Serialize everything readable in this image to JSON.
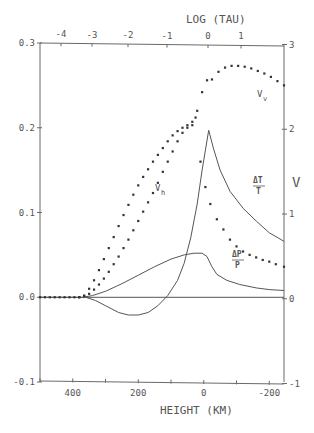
{
  "chart_data": {
    "type": "line",
    "title": "",
    "xlabel": "HEIGHT (KM)",
    "x2label": "LOG (TAU)",
    "ylabel": "",
    "y2label": "V",
    "xlim": [
      500,
      -245
    ],
    "ylim": [
      -0.1,
      0.3
    ],
    "y2lim": [
      -1,
      3
    ],
    "xticks": [
      400,
      200,
      0,
      -200
    ],
    "xticks_minor": [
      500,
      300,
      100,
      -100
    ],
    "x2ticks": [
      {
        "label": "-4",
        "px": 61
      },
      {
        "label": "-3",
        "px": 92
      },
      {
        "label": "-2",
        "px": 128
      },
      {
        "label": "-1",
        "px": 167
      },
      {
        "label": "0",
        "px": 208
      },
      {
        "label": "1",
        "px": 241
      }
    ],
    "yticks": [
      -0.1,
      0.0,
      0.1,
      0.2,
      0.3
    ],
    "yticklabels": [
      "-0.1",
      "0.0",
      "0.1",
      "0.2",
      "0.3"
    ],
    "y2ticks": [
      -1,
      0,
      1,
      2,
      3
    ],
    "grid": false,
    "legend": "inline labels",
    "series": [
      {
        "name": "ΔT/T",
        "style": "line",
        "axis": "left",
        "label_pos": [
          -150,
          0.145
        ],
        "points": [
          [
            500,
            0
          ],
          [
            360,
            0
          ],
          [
            330,
            -0.004
          ],
          [
            300,
            -0.01
          ],
          [
            260,
            -0.018
          ],
          [
            230,
            -0.021
          ],
          [
            200,
            -0.021
          ],
          [
            170,
            -0.018
          ],
          [
            140,
            -0.01
          ],
          [
            110,
            0.002
          ],
          [
            80,
            0.02
          ],
          [
            60,
            0.04
          ],
          [
            40,
            0.07
          ],
          [
            20,
            0.11
          ],
          [
            5,
            0.15
          ],
          [
            -15,
            0.197
          ],
          [
            -30,
            0.175
          ],
          [
            -50,
            0.15
          ],
          [
            -80,
            0.125
          ],
          [
            -120,
            0.105
          ],
          [
            -160,
            0.09
          ],
          [
            -200,
            0.076
          ],
          [
            -245,
            0.066
          ]
        ]
      },
      {
        "name": "ΔP/P",
        "style": "line",
        "axis": "left",
        "label_pos": [
          -150,
          0.04
        ],
        "points": [
          [
            500,
            0
          ],
          [
            370,
            0
          ],
          [
            340,
            0.002
          ],
          [
            300,
            0.007
          ],
          [
            250,
            0.016
          ],
          [
            200,
            0.026
          ],
          [
            150,
            0.036
          ],
          [
            100,
            0.045
          ],
          [
            60,
            0.05
          ],
          [
            30,
            0.052
          ],
          [
            5,
            0.052
          ],
          [
            -10,
            0.048
          ],
          [
            -25,
            0.036
          ],
          [
            -40,
            0.027
          ],
          [
            -70,
            0.02
          ],
          [
            -110,
            0.015
          ],
          [
            -160,
            0.011
          ],
          [
            -200,
            0.009
          ],
          [
            -245,
            0.008
          ]
        ]
      },
      {
        "name": "zero line",
        "style": "line",
        "axis": "left",
        "points": [
          [
            360,
            0
          ],
          [
            -245,
            0
          ]
        ]
      },
      {
        "name": "V_h",
        "style": "dots",
        "axis": "right",
        "label_pos": [
          210,
          1.35
        ],
        "points": [
          [
            500,
            0
          ],
          [
            485,
            0
          ],
          [
            470,
            0
          ],
          [
            455,
            0
          ],
          [
            440,
            0
          ],
          [
            425,
            0
          ],
          [
            410,
            0
          ],
          [
            395,
            0
          ],
          [
            380,
            0
          ],
          [
            365,
            0.02
          ],
          [
            350,
            0.1
          ],
          [
            335,
            0.2
          ],
          [
            320,
            0.32
          ],
          [
            305,
            0.45
          ],
          [
            290,
            0.58
          ],
          [
            275,
            0.71
          ],
          [
            260,
            0.84
          ],
          [
            245,
            0.97
          ],
          [
            230,
            1.09
          ],
          [
            215,
            1.21
          ],
          [
            200,
            1.32
          ],
          [
            185,
            1.42
          ],
          [
            170,
            1.51
          ],
          [
            155,
            1.6
          ],
          [
            140,
            1.68
          ],
          [
            125,
            1.76
          ],
          [
            110,
            1.84
          ],
          [
            95,
            1.91
          ],
          [
            80,
            1.96
          ],
          [
            65,
            2.0
          ],
          [
            50,
            2.03
          ],
          [
            35,
            2.07
          ],
          [
            25,
            2.12
          ]
        ]
      },
      {
        "name": "V_v",
        "style": "dots",
        "axis": "right",
        "label_pos": [
          -145,
          2.5
        ],
        "points": [
          [
            380,
            0
          ],
          [
            365,
            0.01
          ],
          [
            350,
            0.04
          ],
          [
            335,
            0.09
          ],
          [
            320,
            0.15
          ],
          [
            305,
            0.22
          ],
          [
            290,
            0.3
          ],
          [
            275,
            0.39
          ],
          [
            260,
            0.48
          ],
          [
            245,
            0.58
          ],
          [
            230,
            0.68
          ],
          [
            215,
            0.79
          ],
          [
            200,
            0.9
          ],
          [
            185,
            1.01
          ],
          [
            170,
            1.12
          ],
          [
            155,
            1.23
          ],
          [
            140,
            1.35
          ],
          [
            125,
            1.48
          ],
          [
            110,
            1.6
          ],
          [
            95,
            1.72
          ],
          [
            80,
            1.84
          ],
          [
            65,
            1.94
          ],
          [
            50,
            2.0
          ],
          [
            35,
            2.03
          ],
          [
            20,
            2.2
          ],
          [
            5,
            2.42
          ],
          [
            -10,
            2.56
          ],
          [
            -25,
            2.57
          ],
          [
            -45,
            2.66
          ],
          [
            -65,
            2.71
          ],
          [
            -85,
            2.73
          ],
          [
            -105,
            2.73
          ],
          [
            -125,
            2.72
          ],
          [
            -145,
            2.7
          ],
          [
            -165,
            2.67
          ],
          [
            -185,
            2.64
          ],
          [
            -205,
            2.6
          ],
          [
            -225,
            2.55
          ],
          [
            -245,
            2.5
          ]
        ]
      },
      {
        "name": "V_v (lower branch)",
        "style": "dots",
        "axis": "right",
        "points": [
          [
            10,
            1.6
          ],
          [
            -5,
            1.3
          ],
          [
            -20,
            1.1
          ],
          [
            -40,
            0.92
          ],
          [
            -60,
            0.8
          ],
          [
            -80,
            0.68
          ],
          [
            -100,
            0.6
          ],
          [
            -120,
            0.54
          ],
          [
            -140,
            0.5
          ],
          [
            -160,
            0.47
          ],
          [
            -180,
            0.44
          ],
          [
            -200,
            0.42
          ],
          [
            -220,
            0.39
          ],
          [
            -245,
            0.36
          ]
        ]
      }
    ]
  },
  "labels": {
    "x_title": "HEIGHT (KM)",
    "x2_title": "LOG (TAU)",
    "y2_title": "V",
    "vh": "V",
    "vh_sub": "h",
    "vv": "V",
    "vv_sub": "v",
    "dt_num": "ΔT",
    "dt_den": "T",
    "dp_num": "ΔP",
    "dp_den": "P"
  }
}
